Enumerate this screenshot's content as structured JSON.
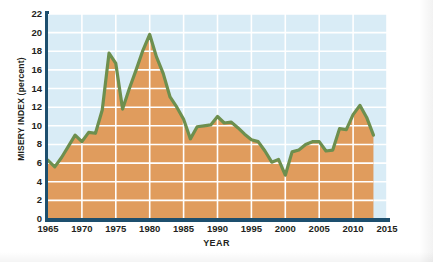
{
  "chart_data": {
    "type": "area",
    "title": "",
    "xlabel": "YEAR",
    "ylabel": "MISERY INDEX (percent)",
    "xlim": [
      1965,
      2015
    ],
    "ylim": [
      0,
      22
    ],
    "xticks": [
      1965,
      1970,
      1975,
      1980,
      1985,
      1990,
      1995,
      2000,
      2005,
      2010,
      2015
    ],
    "yticks": [
      0,
      2,
      4,
      6,
      8,
      10,
      12,
      14,
      16,
      18,
      20,
      22
    ],
    "grid": true,
    "legend": "none",
    "series": [
      {
        "name": "Misery Index",
        "line_color": "#6d8f4e",
        "fill_color": "#e09c5d",
        "x": [
          1965,
          1966,
          1967,
          1968,
          1969,
          1970,
          1971,
          1972,
          1973,
          1974,
          1975,
          1976,
          1977,
          1978,
          1979,
          1980,
          1981,
          1982,
          1983,
          1984,
          1985,
          1986,
          1987,
          1988,
          1989,
          1990,
          1991,
          1992,
          1993,
          1994,
          1995,
          1996,
          1997,
          1998,
          1999,
          2000,
          2001,
          2002,
          2003,
          2004,
          2005,
          2006,
          2007,
          2008,
          2009,
          2010,
          2011,
          2012,
          2013
        ],
        "values": [
          6.3,
          5.6,
          6.6,
          7.8,
          9.0,
          8.3,
          9.3,
          9.2,
          11.7,
          17.8,
          16.7,
          11.8,
          14.0,
          16.0,
          18.1,
          19.8,
          17.4,
          15.6,
          13.1,
          12.0,
          10.7,
          8.6,
          9.9,
          10.0,
          10.1,
          11.0,
          10.3,
          10.4,
          9.8,
          9.1,
          8.5,
          8.3,
          7.3,
          6.1,
          6.4,
          4.7,
          7.2,
          7.4,
          8.0,
          8.3,
          8.3,
          7.3,
          7.4,
          9.7,
          9.6,
          11.2,
          12.2,
          10.9,
          9.0
        ]
      }
    ]
  },
  "axes": {
    "y_title": "MISERY INDEX (percent)",
    "x_title": "YEAR",
    "y_tick_labels": [
      "22",
      "20",
      "18",
      "16",
      "14",
      "12",
      "10",
      "8",
      "6",
      "4",
      "2",
      "0"
    ],
    "x_tick_labels": [
      "1965",
      "1970",
      "1975",
      "1980",
      "1985",
      "1990",
      "1995",
      "2000",
      "2005",
      "2010",
      "2015"
    ]
  },
  "colors": {
    "plot_background": "#d9ecf6",
    "area_fill": "#e09c5d",
    "line": "#6d8f4e",
    "gridline": "#ffffff",
    "axis_spine": "#1d4f6e",
    "text": "#231f20"
  }
}
